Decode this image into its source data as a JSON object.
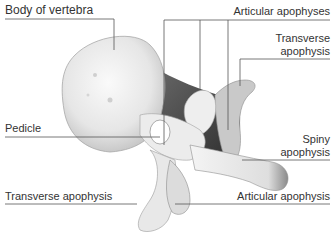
{
  "diagram": {
    "labels": {
      "body_of_vertebra": "Body of vertebra",
      "articular_apophyses_top": "Articular apophyses",
      "transverse_apophysis_top_line1": "Transverse",
      "transverse_apophysis_top_line2": "apophysis",
      "pedicle": "Pedicle",
      "spiny_apophysis_line1": "Spiny",
      "spiny_apophysis_line2": "apophysis",
      "transverse_apophysis_bottom": "Transverse apophysis",
      "articular_apophysis_bottom": "Articular apophysis"
    },
    "colors": {
      "leader_line": "#555555",
      "bone_light": "#f2f2f2",
      "bone_shadow": "#9a9a9a",
      "bone_dark": "#3c3c3c"
    }
  }
}
